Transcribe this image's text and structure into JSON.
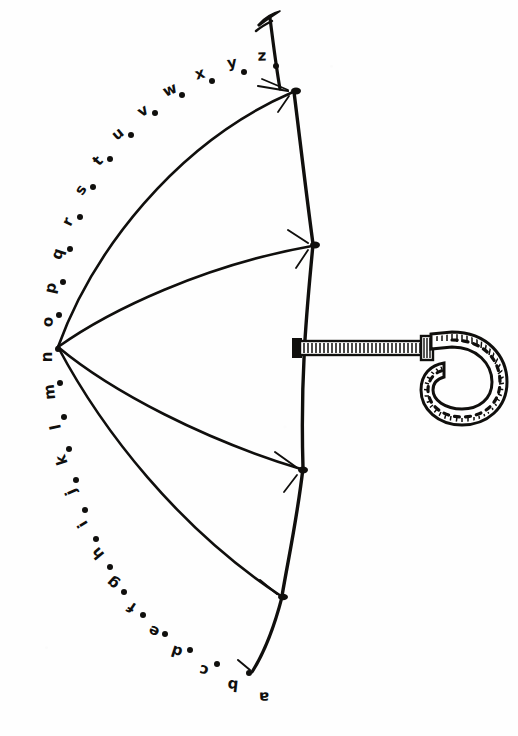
{
  "page": {
    "kind": "connect-the-dots-line-drawing",
    "width": 518,
    "height": 736,
    "background_color": "#fefefe",
    "ink_color": "#100f0d"
  },
  "puzzle": {
    "sequence_type": "lowercase-alphabet",
    "letter_count": 26,
    "letters": [
      "a",
      "b",
      "c",
      "d",
      "e",
      "f",
      "g",
      "h",
      "i",
      "j",
      "k",
      "l",
      "m",
      "n",
      "o",
      "p",
      "q",
      "r",
      "s",
      "t",
      "u",
      "v",
      "w",
      "x",
      "y",
      "z"
    ],
    "dots": [
      {
        "label": "a",
        "dot_x": 249,
        "dot_y": 673,
        "text_x": 264,
        "text_y": 697,
        "rotation": -92
      },
      {
        "label": "b",
        "dot_x": 217,
        "dot_y": 664,
        "text_x": 233,
        "text_y": 685,
        "rotation": -84
      },
      {
        "label": "c",
        "dot_x": 190,
        "dot_y": 650,
        "text_x": 204,
        "text_y": 670,
        "rotation": -78
      },
      {
        "label": "d",
        "dot_x": 165,
        "dot_y": 634,
        "text_x": 177,
        "text_y": 651,
        "rotation": -72
      },
      {
        "label": "e",
        "dot_x": 143,
        "dot_y": 615,
        "text_x": 154,
        "text_y": 631,
        "rotation": -64
      },
      {
        "label": "f",
        "dot_x": 124,
        "dot_y": 592,
        "text_x": 132,
        "text_y": 607,
        "rotation": -56
      },
      {
        "label": "g",
        "dot_x": 110,
        "dot_y": 567,
        "text_x": 113,
        "text_y": 583,
        "rotation": -48
      },
      {
        "label": "h",
        "dot_x": 96,
        "dot_y": 539,
        "text_x": 98,
        "text_y": 553,
        "rotation": -40
      },
      {
        "label": "i",
        "dot_x": 85,
        "dot_y": 510,
        "text_x": 83,
        "text_y": 524,
        "rotation": -32
      },
      {
        "label": "j",
        "dot_x": 76,
        "dot_y": 480,
        "text_x": 71,
        "text_y": 492,
        "rotation": -24
      },
      {
        "label": "k",
        "dot_x": 69,
        "dot_y": 449,
        "text_x": 62,
        "text_y": 460,
        "rotation": -18
      },
      {
        "label": "l",
        "dot_x": 64,
        "dot_y": 417,
        "text_x": 56,
        "text_y": 427,
        "rotation": -12
      },
      {
        "label": "m",
        "dot_x": 60,
        "dot_y": 383,
        "text_x": 50,
        "text_y": 392,
        "rotation": -6
      },
      {
        "label": "n",
        "dot_x": 58,
        "dot_y": 349,
        "text_x": 47,
        "text_y": 357,
        "rotation": 0
      },
      {
        "label": "o",
        "dot_x": 59,
        "dot_y": 315,
        "text_x": 48,
        "text_y": 322,
        "rotation": 6
      },
      {
        "label": "p",
        "dot_x": 63,
        "dot_y": 282,
        "text_x": 51,
        "text_y": 288,
        "rotation": 12
      },
      {
        "label": "q",
        "dot_x": 70,
        "dot_y": 249,
        "text_x": 58,
        "text_y": 254,
        "rotation": 18
      },
      {
        "label": "r",
        "dot_x": 80,
        "dot_y": 217,
        "text_x": 68,
        "text_y": 222,
        "rotation": 26
      },
      {
        "label": "s",
        "dot_x": 93,
        "dot_y": 187,
        "text_x": 81,
        "text_y": 190,
        "rotation": 34
      },
      {
        "label": "t",
        "dot_x": 110,
        "dot_y": 159,
        "text_x": 98,
        "text_y": 161,
        "rotation": 42
      },
      {
        "label": "u",
        "dot_x": 131,
        "dot_y": 135,
        "text_x": 118,
        "text_y": 134,
        "rotation": 50
      },
      {
        "label": "v",
        "dot_x": 155,
        "dot_y": 113,
        "text_x": 143,
        "text_y": 111,
        "rotation": 58
      },
      {
        "label": "w",
        "dot_x": 182,
        "dot_y": 95,
        "text_x": 170,
        "text_y": 90,
        "rotation": 66
      },
      {
        "label": "x",
        "dot_x": 212,
        "dot_y": 81,
        "text_x": 200,
        "text_y": 74,
        "rotation": 74
      },
      {
        "label": "y",
        "dot_x": 244,
        "dot_y": 72,
        "text_x": 232,
        "text_y": 63,
        "rotation": 82
      },
      {
        "label": "z",
        "dot_x": 276,
        "dot_y": 66,
        "text_x": 262,
        "text_y": 56,
        "rotation": 88
      }
    ]
  },
  "umbrella": {
    "parts": [
      "finial-spike",
      "canopy-scallops",
      "canopy-ribs",
      "rib-tip-ferrules",
      "shaft-collar",
      "ribbed-shaft",
      "crook-handle"
    ],
    "canopy": {
      "apex_x": 58,
      "apex_y": 347,
      "rib_tip_count": 4,
      "rib_tips": [
        {
          "x": 295,
          "y": 91
        },
        {
          "x": 314,
          "y": 245
        },
        {
          "x": 303,
          "y": 470
        },
        {
          "x": 282,
          "y": 597
        }
      ]
    },
    "finial": {
      "tip_x": 269,
      "tip_y": 14
    },
    "shaft": {
      "x_start": 296,
      "x_end": 424,
      "y": 348,
      "style": "ribbed-hatched"
    },
    "handle": {
      "style": "j-crook",
      "stitching": "dashed-inner-line",
      "hatching": "outer-edge-ticks"
    }
  }
}
